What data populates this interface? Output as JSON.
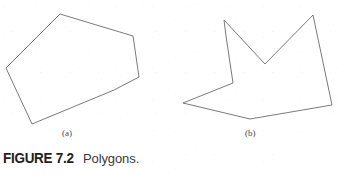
{
  "figure": {
    "caption_number": "FIGURE 7.2",
    "caption_title": "Polygons.",
    "sublabels": {
      "a": "(a)",
      "b": "(b)"
    },
    "stroke_color": "#6b6b6b",
    "background_color": "#ffffff",
    "caption_number_color": "#231f20",
    "caption_title_color": "#3a3a3a",
    "gradient_start_color": "#ffffff",
    "gradient_end_color": "#595959"
  },
  "shapes": {
    "polygon_a": {
      "name": "convex-polygon",
      "vertex_count": 6,
      "points": "60,14 133,36 139,77 114,90 32,124 6,68",
      "fill": "none",
      "stroke_width": 0.9
    },
    "polygon_b": {
      "name": "concave-polygon",
      "vertex_count": 8,
      "points": "224,20 265,64 313,15 332,105 250,119 183,103 233,83 226,36",
      "fill": "none",
      "stroke_width": 0.9
    }
  },
  "gradient_bar": {
    "name": "caption-gradient-rule",
    "x": 135,
    "y": 154,
    "width": 212,
    "height": 13
  }
}
